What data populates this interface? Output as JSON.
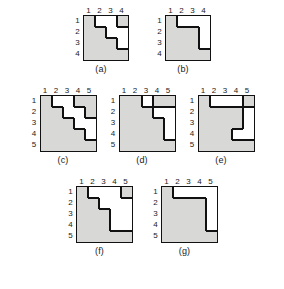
{
  "figure": {
    "cell_size": 11,
    "label_gutter": 9,
    "fill_color": "#d8d8d6",
    "empty_color": "#ffffff",
    "line_color": "#111111",
    "background": "#ffffff",
    "rows": [
      {
        "name": "row-1",
        "diagrams": [
          "a",
          "b"
        ]
      },
      {
        "name": "row-2",
        "diagrams": [
          "c",
          "d",
          "e"
        ]
      },
      {
        "name": "row-3",
        "diagrams": [
          "f",
          "g"
        ]
      }
    ]
  },
  "diagrams": {
    "a": {
      "caption": "(a)",
      "size": 4,
      "col_labels": [
        "1",
        "2",
        "3",
        "4"
      ],
      "row_labels": [
        "1",
        "2",
        "3",
        "4"
      ],
      "filled": [
        [
          1,
          0,
          0,
          1
        ],
        [
          1,
          1,
          0,
          0
        ],
        [
          1,
          1,
          1,
          0
        ],
        [
          1,
          1,
          1,
          1
        ]
      ]
    },
    "b": {
      "caption": "(b)",
      "size": 4,
      "col_labels": [
        "1",
        "2",
        "3",
        "4"
      ],
      "row_labels": [
        "1",
        "2",
        "3",
        "4"
      ],
      "filled": [
        [
          1,
          0,
          0,
          0
        ],
        [
          1,
          1,
          1,
          0
        ],
        [
          1,
          1,
          1,
          0
        ],
        [
          1,
          1,
          1,
          1
        ]
      ]
    },
    "c": {
      "caption": "(c)",
      "size": 5,
      "col_labels": [
        "1",
        "2",
        "3",
        "4",
        "5"
      ],
      "row_labels": [
        "1",
        "2",
        "3",
        "4",
        "5"
      ],
      "filled": [
        [
          1,
          0,
          0,
          1,
          1
        ],
        [
          1,
          1,
          0,
          0,
          1
        ],
        [
          1,
          1,
          1,
          0,
          0
        ],
        [
          1,
          1,
          1,
          1,
          0
        ],
        [
          1,
          1,
          1,
          1,
          1
        ]
      ]
    },
    "d": {
      "caption": "(d)",
      "size": 5,
      "col_labels": [
        "1",
        "2",
        "3",
        "4",
        "5"
      ],
      "row_labels": [
        "1",
        "2",
        "3",
        "4",
        "5"
      ],
      "filled": [
        [
          1,
          1,
          0,
          1,
          1
        ],
        [
          1,
          1,
          1,
          0,
          0
        ],
        [
          1,
          1,
          1,
          1,
          0
        ],
        [
          1,
          1,
          1,
          1,
          0
        ],
        [
          1,
          1,
          1,
          1,
          1
        ]
      ]
    },
    "e": {
      "caption": "(e)",
      "size": 5,
      "col_labels": [
        "1",
        "2",
        "3",
        "4",
        "5"
      ],
      "row_labels": [
        "1",
        "2",
        "3",
        "4",
        "5"
      ],
      "filled": [
        [
          1,
          0,
          0,
          0,
          1
        ],
        [
          1,
          1,
          1,
          1,
          0
        ],
        [
          1,
          1,
          1,
          1,
          0
        ],
        [
          1,
          1,
          1,
          0,
          0
        ],
        [
          1,
          1,
          1,
          1,
          1
        ]
      ]
    },
    "f": {
      "caption": "(f)",
      "size": 5,
      "col_labels": [
        "1",
        "2",
        "3",
        "4",
        "5"
      ],
      "row_labels": [
        "1",
        "2",
        "3",
        "4",
        "5"
      ],
      "filled": [
        [
          1,
          0,
          0,
          0,
          1
        ],
        [
          1,
          1,
          0,
          0,
          0
        ],
        [
          1,
          1,
          1,
          0,
          0
        ],
        [
          1,
          1,
          1,
          0,
          0
        ],
        [
          1,
          1,
          1,
          1,
          1
        ]
      ]
    },
    "g": {
      "caption": "(g)",
      "size": 5,
      "col_labels": [
        "1",
        "2",
        "3",
        "4",
        "5"
      ],
      "row_labels": [
        "1",
        "2",
        "3",
        "4",
        "5"
      ],
      "filled": [
        [
          1,
          0,
          0,
          0,
          0
        ],
        [
          1,
          1,
          1,
          1,
          0
        ],
        [
          1,
          1,
          1,
          1,
          0
        ],
        [
          1,
          1,
          1,
          1,
          0
        ],
        [
          1,
          1,
          1,
          1,
          1
        ]
      ]
    }
  }
}
